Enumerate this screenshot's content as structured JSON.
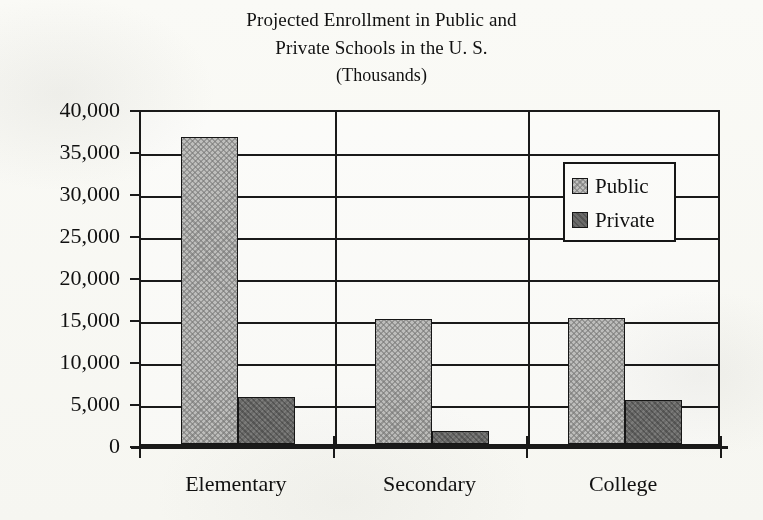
{
  "title": {
    "line1": "Projected Enrollment in Public and",
    "line2": "Private Schools in the U. S.",
    "line3": "(Thousands)"
  },
  "legend": {
    "position": "top-right-inside-plot",
    "entries": [
      {
        "label": "Public",
        "color": "#c2c2c2",
        "pattern": "crosshatch"
      },
      {
        "label": "Private",
        "color": "#6d6d6d",
        "pattern": "solid-dark"
      }
    ]
  },
  "axes": {
    "y_tick_labels": [
      "40,000",
      "35,000",
      "30,000",
      "25,000",
      "20,000",
      "15,000",
      "10,000",
      "5,000",
      "0"
    ],
    "y_tick_values": [
      40000,
      35000,
      30000,
      25000,
      20000,
      15000,
      10000,
      5000,
      0
    ],
    "x_tick_labels": [
      "Elementary",
      "Secondary",
      "College"
    ]
  },
  "chart_data": {
    "type": "bar",
    "title": "Projected Enrollment in Public and Private Schools in the U. S. (Thousands)",
    "xlabel": "",
    "ylabel": "",
    "ylim": [
      0,
      40000
    ],
    "ytick_step": 5000,
    "grid": true,
    "legend_position": "upper right",
    "categories": [
      "Elementary",
      "Secondary",
      "College"
    ],
    "series": [
      {
        "name": "Public",
        "values": [
          36500,
          14900,
          15000
        ],
        "color": "#c2c2c2"
      },
      {
        "name": "Private",
        "values": [
          5550,
          1550,
          5200
        ],
        "color": "#6d6d6d"
      }
    ],
    "units": "Thousands"
  }
}
